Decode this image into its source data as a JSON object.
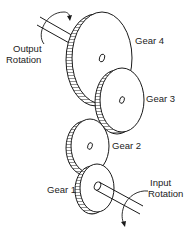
{
  "diagram": {
    "colors": {
      "line": "#1a1a1a",
      "face": "#ffffff",
      "teeth": "#2a2a2a",
      "text": "#222222",
      "background": "#ffffff"
    },
    "labels": {
      "gear4": "Gear 4",
      "gear3": "Gear 3",
      "gear2": "Gear 2",
      "gear1": "Gear 1",
      "output_line1": "Output",
      "output_line2": "Rotation",
      "input_line1": "Input",
      "input_line2": "Rotation"
    },
    "gears": [
      {
        "name": "Gear 1",
        "role": "input (driver)"
      },
      {
        "name": "Gear 2",
        "role": "idler"
      },
      {
        "name": "Gear 3",
        "role": "idler"
      },
      {
        "name": "Gear 4",
        "role": "output (driven)"
      }
    ]
  }
}
